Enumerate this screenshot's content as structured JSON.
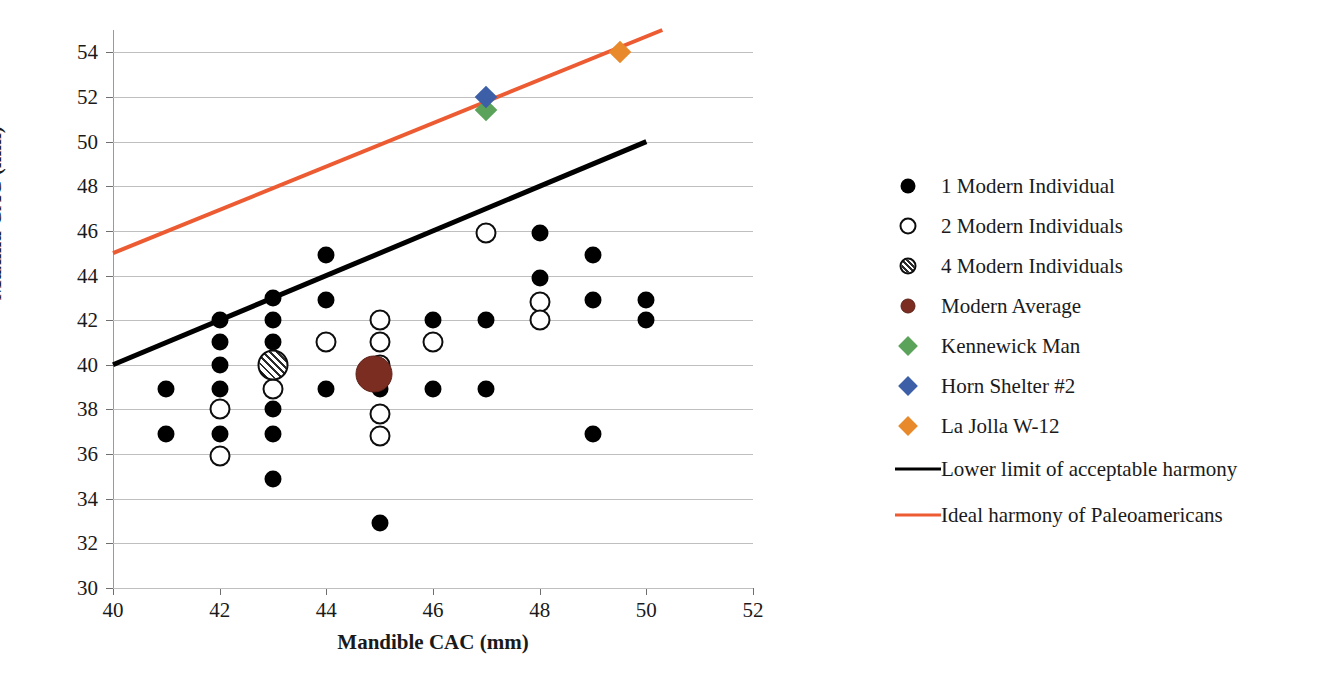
{
  "chart_data": {
    "type": "scatter",
    "title": "",
    "xlabel": "Mandible CAC (mm)",
    "ylabel": "Maxilla CAC (mm)",
    "xlim": [
      40,
      52
    ],
    "ylim": [
      30,
      55
    ],
    "xticks": [
      40,
      42,
      44,
      46,
      48,
      50,
      52
    ],
    "yticks": [
      30,
      32,
      34,
      36,
      38,
      40,
      42,
      44,
      46,
      48,
      50,
      52,
      54
    ],
    "grid": "horizontal",
    "legend_position": "right",
    "series": [
      {
        "name": "1 Modern Individual",
        "marker": "filled-circle",
        "color": "#000000",
        "points": [
          [
            41,
            38.9
          ],
          [
            41,
            36.9
          ],
          [
            42,
            42
          ],
          [
            42,
            41
          ],
          [
            42,
            40
          ],
          [
            42,
            38.9
          ],
          [
            42,
            36.9
          ],
          [
            43,
            43
          ],
          [
            43,
            42
          ],
          [
            43,
            41
          ],
          [
            43,
            38
          ],
          [
            43,
            36.9
          ],
          [
            43,
            34.9
          ],
          [
            44,
            44.9
          ],
          [
            44,
            42.9
          ],
          [
            44,
            38.9
          ],
          [
            45,
            38.9
          ],
          [
            45,
            32.9
          ],
          [
            46,
            42
          ],
          [
            46,
            38.9
          ],
          [
            47,
            42
          ],
          [
            47,
            38.9
          ],
          [
            48,
            45.9
          ],
          [
            48,
            43.9
          ],
          [
            49,
            44.9
          ],
          [
            49,
            42.9
          ],
          [
            49,
            36.9
          ],
          [
            50,
            42.9
          ],
          [
            50,
            42
          ]
        ]
      },
      {
        "name": "2 Modern Individuals",
        "marker": "open-circle",
        "color": "#ffffff",
        "points": [
          [
            42,
            38
          ],
          [
            42,
            35.9
          ],
          [
            43,
            38.9
          ],
          [
            44,
            41
          ],
          [
            45,
            42
          ],
          [
            45,
            41
          ],
          [
            45,
            40
          ],
          [
            45,
            37.8
          ],
          [
            45,
            36.8
          ],
          [
            46,
            41
          ],
          [
            47,
            45.9
          ],
          [
            48,
            42.8
          ],
          [
            48,
            42
          ]
        ]
      },
      {
        "name": "4 Modern Individuals",
        "marker": "hatched-circle",
        "color": "#bfbfbf",
        "points": [
          [
            43,
            40
          ]
        ]
      },
      {
        "name": "Modern Average",
        "marker": "filled-circle-large",
        "color": "#7b2d21",
        "points": [
          [
            44.9,
            39.6
          ]
        ]
      },
      {
        "name": "Kennewick Man",
        "marker": "diamond",
        "color": "#5ba35b",
        "points": [
          [
            47,
            51.4
          ]
        ]
      },
      {
        "name": "Horn Shelter #2",
        "marker": "diamond",
        "color": "#3d5fa8",
        "points": [
          [
            47,
            52
          ]
        ]
      },
      {
        "name": "La Jolla W-12",
        "marker": "diamond",
        "color": "#e8892b",
        "points": [
          [
            49.5,
            54
          ]
        ]
      }
    ],
    "lines": [
      {
        "name": "Lower limit of acceptable harmony",
        "color": "#000000",
        "from": [
          40,
          40
        ],
        "to": [
          50,
          50
        ]
      },
      {
        "name": "Ideal harmony of Paleoamericans",
        "color": "#ed5B33",
        "from": [
          40,
          45
        ],
        "to": [
          50.3,
          55
        ]
      }
    ]
  },
  "legend": {
    "items": [
      {
        "label": "1 Modern Individual",
        "key": "filled-circle",
        "color": "#000000"
      },
      {
        "label": "2 Modern Individuals",
        "key": "open-circle",
        "color": "#ffffff"
      },
      {
        "label": "4 Modern Individuals",
        "key": "hatched-circle",
        "color": "#bfbfbf"
      },
      {
        "label": "Modern Average",
        "key": "filled-circle",
        "color": "#7b2d21"
      },
      {
        "label": "Kennewick Man",
        "key": "diamond",
        "color": "#5ba35b"
      },
      {
        "label": "Horn Shelter #2",
        "key": "diamond",
        "color": "#3d5fa8"
      },
      {
        "label": "La Jolla W-12",
        "key": "diamond",
        "color": "#e8892b"
      },
      {
        "label": "Lower limit of acceptable harmony",
        "key": "line",
        "color": "#000000"
      },
      {
        "label": "Ideal harmony of Paleoamericans",
        "key": "line",
        "color": "#ed5B33"
      }
    ]
  },
  "axes": {
    "y_title": "Maxilla CAC (mm)",
    "x_title": "Mandible CAC (mm)",
    "y_tick_labels": [
      "54",
      "52",
      "50",
      "48",
      "46",
      "44",
      "42",
      "40",
      "38",
      "36",
      "34",
      "32",
      "30"
    ],
    "x_tick_labels": [
      "40",
      "42",
      "44",
      "46",
      "48",
      "50",
      "52"
    ]
  }
}
